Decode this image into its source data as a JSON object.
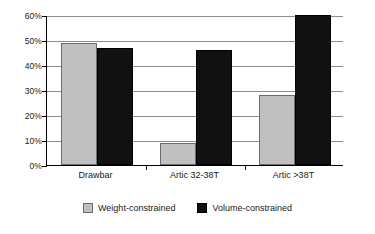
{
  "chart_data": {
    "type": "bar",
    "title": "",
    "subtitle": "",
    "xlabel": "",
    "ylabel": "",
    "categories": [
      "Drawbar",
      "Artic 32-38T",
      "Artic >38T"
    ],
    "series": [
      {
        "name": "Weight-constrained",
        "color": "#c0c0c0",
        "values": [
          49,
          9,
          28
        ]
      },
      {
        "name": "Volume-constrained",
        "color": "#111111",
        "values": [
          47,
          46,
          60
        ]
      }
    ],
    "ylim": [
      0,
      60
    ],
    "ytick_values": [
      0,
      10,
      20,
      30,
      40,
      50,
      60
    ],
    "ytick_labels": [
      "0%",
      "10%",
      "20%",
      "30%",
      "40%",
      "50%",
      "60%"
    ],
    "grid": true,
    "grid_axis": "y",
    "legend_position": "bottom",
    "annotations": []
  },
  "legend": {
    "entries": [
      {
        "label": "Weight-constrained",
        "swatch": "weight-constrained-swatch"
      },
      {
        "label": "Volume-constrained",
        "swatch": "volume-constrained-swatch"
      }
    ]
  }
}
